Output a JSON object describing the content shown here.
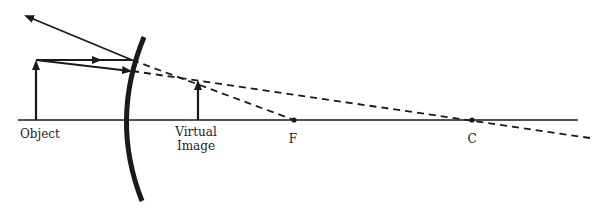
{
  "diagram": {
    "type": "convex-mirror-ray-diagram",
    "labels": {
      "object": "Object",
      "virtual_image_line1": "Virtual",
      "virtual_image_line2": "Image",
      "focal_point": "F",
      "center_of_curvature": "C"
    },
    "colors": {
      "line": "#1a1a1a",
      "background": "#ffffff"
    },
    "elements": {
      "principal_axis": "solid horizontal line",
      "mirror": "convex mirror (thick curved arc)",
      "object_arrow": "upright arrow left of mirror",
      "virtual_image_arrow": "smaller upright arrow behind mirror",
      "incident_rays": [
        "ray parallel to axis",
        "ray aimed toward C"
      ],
      "reflected_ray": "ray reflected up-left",
      "extension_lines": [
        "dashed line to F",
        "dashed line through C"
      ]
    }
  }
}
